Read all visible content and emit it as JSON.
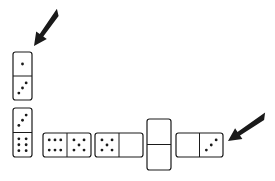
{
  "figure": {
    "colors": {
      "ink": "#1a1a1a",
      "background": "#ffffff"
    }
  },
  "dominoes": [
    {
      "id": "top-vertical",
      "orientation": "vertical",
      "x": 13,
      "y": 52,
      "w": 19,
      "h": 48,
      "halves": [
        1,
        3
      ]
    },
    {
      "id": "bottom-vertical",
      "orientation": "vertical",
      "x": 13,
      "y": 108,
      "w": 19,
      "h": 49,
      "halves": [
        3,
        6
      ]
    },
    {
      "id": "horizontal-6-5",
      "orientation": "horizontal",
      "x": 43,
      "y": 133,
      "w": 48,
      "h": 24,
      "halves": [
        6,
        5
      ]
    },
    {
      "id": "horizontal-5-0",
      "orientation": "horizontal",
      "x": 95,
      "y": 133,
      "w": 48,
      "h": 24,
      "halves": [
        5,
        0
      ]
    },
    {
      "id": "vertical-0-0",
      "orientation": "vertical",
      "x": 147,
      "y": 119,
      "w": 24,
      "h": 51,
      "halves": [
        0,
        0
      ]
    },
    {
      "id": "horizontal-0-3",
      "orientation": "horizontal",
      "x": 176,
      "y": 133,
      "w": 47,
      "h": 24,
      "halves": [
        0,
        3
      ]
    }
  ],
  "arrows": [
    {
      "id": "arrow-top",
      "from": [
        58,
        12
      ],
      "to": [
        34,
        46
      ]
    },
    {
      "id": "arrow-right",
      "from": [
        265,
        116
      ],
      "to": [
        228,
        141
      ]
    }
  ]
}
